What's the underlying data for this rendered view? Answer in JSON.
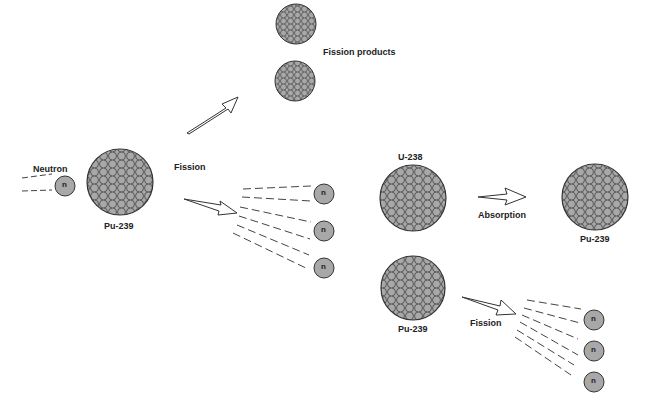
{
  "diagram": {
    "colors": {
      "nucleon_fill": "#a8a8a8",
      "stroke": "#333333",
      "background": "#ffffff"
    },
    "labels": {
      "neutron": "Neutron",
      "pu239_left": "Pu-239",
      "fission_left": "Fission",
      "fission_products": "Fission products",
      "u238": "U-238",
      "absorption": "Absorption",
      "pu239_right": "Pu-239",
      "pu239_bottom": "Pu-239",
      "fission_bottom": "Fission"
    },
    "neutron_symbol": "n"
  }
}
